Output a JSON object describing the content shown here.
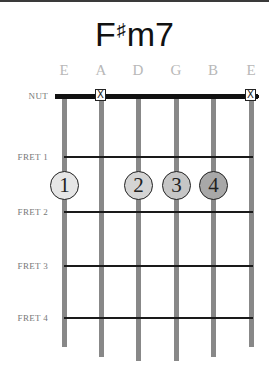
{
  "chord": {
    "root": "F",
    "accidental": "♯",
    "quality": "m7",
    "name": "F♯m7"
  },
  "strings": [
    {
      "label": "E",
      "x": 64,
      "end_y": 347,
      "state": "fretted"
    },
    {
      "label": "A",
      "x": 101,
      "end_y": 357,
      "state": "muted"
    },
    {
      "label": "D",
      "x": 138,
      "end_y": 361,
      "state": "fretted"
    },
    {
      "label": "G",
      "x": 176,
      "end_y": 361,
      "state": "fretted"
    },
    {
      "label": "B",
      "x": 213,
      "end_y": 357,
      "state": "fretted"
    },
    {
      "label": "E",
      "x": 251,
      "end_y": 347,
      "state": "muted"
    }
  ],
  "rows": [
    {
      "label": "NUT",
      "y": 96
    },
    {
      "label": "FRET 1",
      "y": 157
    },
    {
      "label": "FRET 2",
      "y": 212
    },
    {
      "label": "FRET 3",
      "y": 266
    },
    {
      "label": "FRET 4",
      "y": 318
    }
  ],
  "mute_marker": "☒",
  "mute_symbol": "X",
  "fingers": [
    {
      "finger": "1",
      "string_index": 0,
      "fret": 2,
      "x": 64,
      "fill": "#e6e6e6"
    },
    {
      "finger": "2",
      "string_index": 2,
      "fret": 2,
      "x": 138,
      "fill": "#d4d4d4"
    },
    {
      "finger": "3",
      "string_index": 3,
      "fret": 2,
      "x": 176,
      "fill": "#c6c6c6"
    },
    {
      "finger": "4",
      "string_index": 4,
      "fret": 2,
      "x": 213,
      "fill": "#a8a8a8"
    }
  ],
  "colors": {
    "nut": "#111111",
    "string": "#888888",
    "fret": "#1a1a1a",
    "string_label": "#b8b8b8",
    "row_label": "#777777"
  }
}
